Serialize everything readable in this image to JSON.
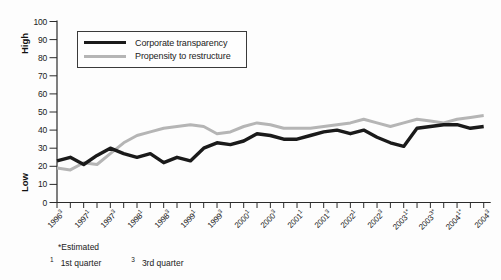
{
  "chart_data": {
    "type": "line",
    "title": "",
    "x": [
      "1996 Q3",
      "1996 Q4",
      "1997 Q1",
      "1997 Q2",
      "1997 Q3",
      "1997 Q4",
      "1998 Q1",
      "1998 Q2",
      "1998 Q3",
      "1998 Q4",
      "1999 Q1",
      "1999 Q2",
      "1999 Q3",
      "1999 Q4",
      "2000 Q1",
      "2000 Q2",
      "2000 Q3",
      "2000 Q4",
      "2001 Q1",
      "2001 Q2",
      "2001 Q3",
      "2001 Q4",
      "2002 Q1",
      "2002 Q2",
      "2002 Q3",
      "2002 Q4",
      "2003 Q1",
      "2003 Q2",
      "2003 Q3",
      "2003 Q4",
      "2004 Q1",
      "2004 Q2",
      "2004 Q3"
    ],
    "series": [
      {
        "name": "Corporate transparency",
        "color": "#1a1a1a",
        "stroke_width": 3.4,
        "values": [
          23,
          25,
          21,
          26,
          30,
          27,
          25,
          27,
          22,
          25,
          23,
          30,
          33,
          32,
          34,
          38,
          37,
          35,
          35,
          37,
          39,
          40,
          38,
          40,
          36,
          33,
          31,
          41,
          42,
          43,
          43,
          41,
          42
        ]
      },
      {
        "name": "Propensity to restructure",
        "color": "#b5b5b5",
        "stroke_width": 3,
        "values": [
          19,
          18,
          22,
          21,
          27,
          33,
          37,
          39,
          41,
          42,
          43,
          42,
          38,
          39,
          42,
          44,
          43,
          41,
          41,
          41,
          42,
          43,
          44,
          46,
          44,
          42,
          44,
          46,
          45,
          44,
          46,
          47,
          48
        ]
      }
    ],
    "ylim": [
      0,
      100
    ],
    "yticks": [
      0,
      10,
      20,
      30,
      40,
      50,
      60,
      70,
      80,
      90,
      100
    ],
    "y_axis_high_label": "High",
    "y_axis_low_label": "Low",
    "grid": false,
    "legend_position": "top-left",
    "x_tick_labels": [
      {
        "year": "1996",
        "q": "3",
        "est": false
      },
      {
        "year": "1997",
        "q": "1",
        "est": false
      },
      {
        "year": "1997",
        "q": "3",
        "est": false
      },
      {
        "year": "1998",
        "q": "1",
        "est": false
      },
      {
        "year": "1998",
        "q": "3",
        "est": false
      },
      {
        "year": "1999",
        "q": "1",
        "est": false
      },
      {
        "year": "1999",
        "q": "3",
        "est": false
      },
      {
        "year": "2000",
        "q": "1",
        "est": false
      },
      {
        "year": "2000",
        "q": "3",
        "est": false
      },
      {
        "year": "2001",
        "q": "1",
        "est": false
      },
      {
        "year": "2001",
        "q": "3",
        "est": false
      },
      {
        "year": "2002",
        "q": "1",
        "est": false
      },
      {
        "year": "2002",
        "q": "3",
        "est": false
      },
      {
        "year": "2003",
        "q": "1",
        "est": true
      },
      {
        "year": "2003",
        "q": "3",
        "est": true
      },
      {
        "year": "2004",
        "q": "1",
        "est": true
      },
      {
        "year": "2004",
        "q": "3",
        "est": false
      }
    ]
  },
  "footnotes": {
    "estimated": "*Estimated",
    "q1_sup": "1",
    "q1_text": "1st quarter",
    "q3_sup": "3",
    "q3_text": "3rd quarter"
  }
}
